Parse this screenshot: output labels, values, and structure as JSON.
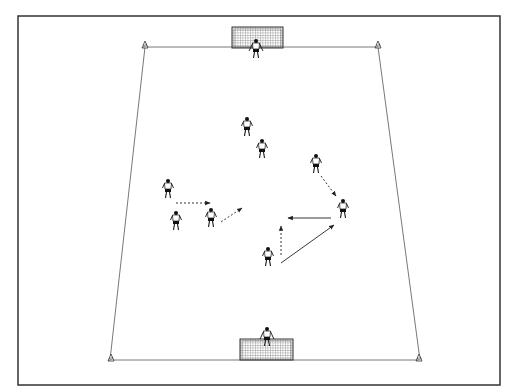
{
  "diagram": {
    "type": "soccer-training-drill",
    "frame": {
      "x": 18,
      "y": 16,
      "w": 482,
      "h": 369,
      "stroke": "#333333"
    },
    "pitch": {
      "top_left": [
        145,
        47
      ],
      "top_right": [
        378,
        47
      ],
      "bottom_right": [
        420,
        360
      ],
      "bottom_left": [
        110,
        360
      ],
      "line_color": "#555555"
    },
    "goals": [
      {
        "id": "top-goal",
        "x": 232,
        "y": 27,
        "w": 51,
        "h": 21
      },
      {
        "id": "bottom-goal",
        "x": 240,
        "y": 339,
        "w": 53,
        "h": 21
      }
    ],
    "cones": [
      {
        "id": "cone-top-left",
        "x": 145,
        "y": 47
      },
      {
        "id": "cone-top-right",
        "x": 378,
        "y": 47
      },
      {
        "id": "cone-bottom-left",
        "x": 111,
        "y": 360
      },
      {
        "id": "cone-bottom-right",
        "x": 419,
        "y": 360
      }
    ],
    "players": [
      {
        "id": "goalkeeper-top",
        "x": 256,
        "y": 50,
        "role": "goalkeeper"
      },
      {
        "id": "goalkeeper-bottom",
        "x": 267,
        "y": 338,
        "role": "goalkeeper"
      },
      {
        "id": "player-1",
        "x": 247,
        "y": 128,
        "role": "outfield"
      },
      {
        "id": "player-2",
        "x": 262,
        "y": 150,
        "role": "outfield"
      },
      {
        "id": "player-3",
        "x": 316,
        "y": 165,
        "role": "outfield"
      },
      {
        "id": "player-4",
        "x": 168,
        "y": 190,
        "role": "outfield"
      },
      {
        "id": "player-5",
        "x": 176,
        "y": 222,
        "role": "outfield"
      },
      {
        "id": "player-6",
        "x": 211,
        "y": 219,
        "role": "outfield"
      },
      {
        "id": "player-7",
        "x": 343,
        "y": 210,
        "role": "outfield"
      },
      {
        "id": "player-8",
        "x": 268,
        "y": 258,
        "role": "outfield"
      }
    ],
    "arrows": [
      {
        "id": "run-1",
        "from": [
          176,
          203
        ],
        "to": [
          210,
          203
        ],
        "style": "dashed"
      },
      {
        "id": "run-2",
        "from": [
          221,
          222
        ],
        "to": [
          242,
          208
        ],
        "style": "dashed"
      },
      {
        "id": "run-3",
        "from": [
          321,
          176
        ],
        "to": [
          336,
          196
        ],
        "style": "dashed"
      },
      {
        "id": "pass-1",
        "from": [
          331,
          218
        ],
        "to": [
          288,
          218
        ],
        "style": "solid"
      },
      {
        "id": "run-4",
        "from": [
          281,
          255
        ],
        "to": [
          281,
          226
        ],
        "style": "dashed"
      },
      {
        "id": "pass-2",
        "from": [
          281,
          263
        ],
        "to": [
          334,
          225
        ],
        "style": "solid"
      }
    ]
  }
}
